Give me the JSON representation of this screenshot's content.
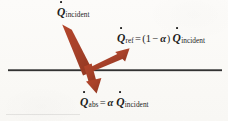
{
  "figure": {
    "background_color": "#FBFAF7",
    "arrow_color": "#A8422A",
    "surface_line_color": "#2B2B2B",
    "text_color": "#1D1D1D"
  },
  "surface": {
    "name": "surface-boundary-line",
    "x_start": 8,
    "x_end": 222,
    "y": 70,
    "thickness": 2
  },
  "labels": {
    "incident": {
      "symbol": "Q",
      "dot": true,
      "subscript": "incident",
      "full_text": "Q̇incident"
    },
    "reflected": {
      "symbol": "Q",
      "dot": true,
      "subscript": "ref",
      "equals": "=",
      "open_paren": "(",
      "one": "1",
      "minus": "−",
      "alpha": "α",
      "close_paren": ")",
      "rhs_symbol": "Q",
      "rhs_subscript": "incident",
      "full_text": "Q̇ref = (1 − α) Q̇incident"
    },
    "absorbed": {
      "symbol": "Q",
      "dot": true,
      "subscript": "abs",
      "equals": "=",
      "alpha": "α",
      "rhs_symbol": "Q",
      "rhs_subscript": "incident",
      "full_text": "Q̇abs = α Q̇incident"
    }
  },
  "arrows": [
    {
      "name": "incident-radiation-arrow",
      "direction": "down-right",
      "tail": [
        66,
        26
      ],
      "head": [
        92,
        74
      ],
      "color": "#A8422A",
      "shaft_width": 11
    },
    {
      "name": "reflected-radiation-arrow",
      "direction": "up-right",
      "tail": [
        88,
        72
      ],
      "head": [
        129,
        49
      ],
      "color": "#A8422A",
      "shaft_width": 7
    },
    {
      "name": "absorbed-radiation-arrow",
      "direction": "down-right",
      "tail": [
        86,
        66
      ],
      "head": [
        96,
        93
      ],
      "color": "#A8422A",
      "shaft_width": 7
    }
  ]
}
